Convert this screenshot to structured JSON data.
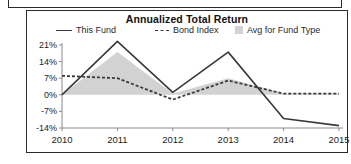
{
  "panel": {
    "title": "Annualized Total Return"
  },
  "legend": [
    {
      "label": "This Fund",
      "marker": "solid-line-swatch"
    },
    {
      "label": "Bond Index",
      "marker": "dashed-line-swatch"
    },
    {
      "label": "Avg for Fund Type",
      "marker": "filled-band-swatch"
    }
  ],
  "axis": {
    "y_ticks": [
      "21%",
      "14%",
      "7%",
      "0%",
      "-7%",
      "-14%"
    ],
    "x_ticks": [
      "2010",
      "2011",
      "2012",
      "2013",
      "2014",
      "2015"
    ],
    "x_suffix": "YTD"
  },
  "colors": {
    "this_fund_line": "#3a3a3a",
    "bond_index_line": "#3a3a3a",
    "avg_band_fill": "#d2d2d2",
    "axis": "#8a8a8a",
    "panel_border": "#2b2b2b",
    "text": "#1d1d1d",
    "background": "#ffffff"
  },
  "chart_data": {
    "type": "line",
    "title": "Annualized Total Return",
    "xlabel": "",
    "ylabel": "",
    "categories": [
      "2010",
      "2011",
      "2012",
      "2013",
      "2014",
      "2015"
    ],
    "x_note": "YTD",
    "ylim": [
      -14,
      21
    ],
    "y_ticks": [
      21,
      14,
      7,
      0,
      -7,
      -14
    ],
    "y_unit": "%",
    "grid": false,
    "legend_position": "top",
    "series": [
      {
        "name": "This Fund",
        "style": "solid",
        "color": "#3a3a3a",
        "values": [
          0.0,
          22.5,
          1.0,
          18.0,
          -10.0,
          -13.0
        ]
      },
      {
        "name": "Bond Index",
        "style": "dashed",
        "color": "#3a3a3a",
        "values": [
          8.0,
          7.0,
          -2.0,
          6.0,
          0.5,
          0.5
        ]
      },
      {
        "name": "Avg for Fund Type",
        "style": "band",
        "color": "#d2d2d2",
        "values": [
          0.0,
          18.0,
          0.5,
          7.0,
          0.5,
          0.5
        ],
        "baseline": 0
      }
    ]
  }
}
